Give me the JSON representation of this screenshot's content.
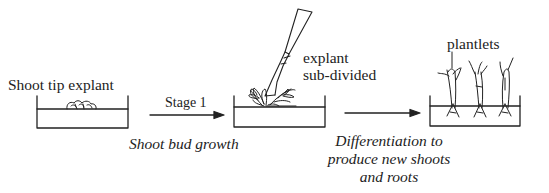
{
  "diagram": {
    "type": "plant tissue culture process",
    "stages": [
      {
        "id": "explant",
        "label": "Shoot tip explant"
      },
      {
        "id": "subdivided",
        "label_line1": "explant",
        "label_line2": "sub-divided"
      },
      {
        "id": "plantlets",
        "label": "plantlets"
      }
    ],
    "arrows": [
      {
        "id": "arrow-1",
        "above": "Stage 1",
        "below": "Shoot bud growth"
      },
      {
        "id": "arrow-2",
        "below_line1": "Differentiation to",
        "below_line2": "produce new shoots",
        "below_line3": "and roots"
      }
    ],
    "colors": {
      "ink": "#222222",
      "background": "#ffffff"
    }
  }
}
